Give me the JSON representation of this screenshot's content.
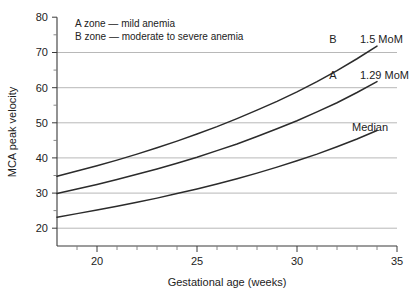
{
  "chart_data": {
    "type": "line",
    "title": "",
    "xlabel": "Gestational age (weeks)",
    "ylabel": "MCA peak velocity",
    "xlim": [
      18,
      35
    ],
    "ylim": [
      15,
      80
    ],
    "xticks": [
      20,
      25,
      30,
      35
    ],
    "xticks_labels": [
      "20",
      "25",
      "30",
      "35"
    ],
    "xminor_step": 1,
    "yticks": [
      20,
      30,
      40,
      50,
      60,
      70,
      80
    ],
    "yticks_labels": [
      "20",
      "30",
      "40",
      "50",
      "60",
      "70",
      "80"
    ],
    "yminor": [
      25,
      35,
      45,
      55,
      65,
      75
    ],
    "grid": "horizontal",
    "gridlines_at": [
      20,
      30,
      40,
      50,
      60,
      70
    ],
    "legend_position": "top-left-inside",
    "series": [
      {
        "name": "1.5 MoM",
        "label": "1.5 MoM",
        "marker_label": "B",
        "color": "#2b2b2b",
        "x": [
          18,
          19,
          20,
          21,
          22,
          23,
          24,
          25,
          26,
          27,
          28,
          29,
          30,
          31,
          32,
          33,
          34
        ],
        "values": [
          34.8,
          36.3,
          37.8,
          39.4,
          41.1,
          42.9,
          44.8,
          46.8,
          48.9,
          51.2,
          53.6,
          56.1,
          58.8,
          61.7,
          64.8,
          68.2,
          71.8
        ]
      },
      {
        "name": "1.29 MoM",
        "label": "1.29 MoM",
        "marker_label": "A",
        "color": "#2b2b2b",
        "x": [
          18,
          19,
          20,
          21,
          22,
          23,
          24,
          25,
          26,
          27,
          28,
          29,
          30,
          31,
          32,
          33,
          34
        ],
        "values": [
          29.9,
          31.2,
          32.5,
          33.9,
          35.4,
          36.9,
          38.5,
          40.2,
          42.1,
          44.0,
          46.1,
          48.3,
          50.6,
          53.1,
          55.7,
          58.6,
          61.7
        ]
      },
      {
        "name": "Median",
        "label": "Median",
        "marker_label": "",
        "color": "#2b2b2b",
        "x": [
          18,
          19,
          20,
          21,
          22,
          23,
          24,
          25,
          26,
          27,
          28,
          29,
          30,
          31,
          32,
          33,
          34
        ],
        "values": [
          23.2,
          24.2,
          25.2,
          26.3,
          27.4,
          28.6,
          29.9,
          31.2,
          32.6,
          34.1,
          35.7,
          37.4,
          39.2,
          41.1,
          43.2,
          45.4,
          47.8
        ]
      }
    ],
    "annotations": [
      {
        "name": "legend-line-a",
        "text": "A zone — mild anemia"
      },
      {
        "name": "legend-line-b",
        "text": "B zone — moderate to severe anemia"
      }
    ]
  },
  "colors": {
    "curve": "#2b2b2b",
    "grid": "#9a9a9a",
    "axis": "#3a3a3a",
    "text": "#222222",
    "background": "#ffffff"
  }
}
